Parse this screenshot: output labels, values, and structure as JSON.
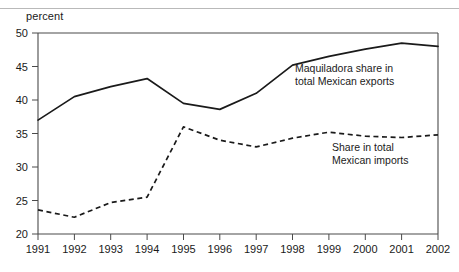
{
  "axis_unit_label": "percent",
  "chart_data": {
    "type": "line",
    "title": "",
    "xlabel": "",
    "ylabel": "percent",
    "xlim": [
      1991,
      2002
    ],
    "ylim": [
      20,
      50
    ],
    "yticks": [
      20,
      25,
      30,
      35,
      40,
      45,
      50
    ],
    "xticks": [
      1991,
      1992,
      1993,
      1994,
      1995,
      1996,
      1997,
      1998,
      1999,
      2000,
      2001,
      2002
    ],
    "grid": false,
    "legend_position": "inline-annotations",
    "categories": [
      "1991",
      "1992",
      "1993",
      "1994",
      "1995",
      "1996",
      "1997",
      "1998",
      "1999",
      "2000",
      "2001",
      "2002"
    ],
    "x": [
      1991,
      1992,
      1993,
      1994,
      1995,
      1996,
      1997,
      1998,
      1999,
      2000,
      2001,
      2002
    ],
    "series": [
      {
        "name": "Maquiladora share in total Mexican exports",
        "style": "solid",
        "color": "#1a1a1a",
        "values": [
          37.0,
          40.5,
          42.0,
          43.2,
          39.5,
          38.6,
          41.0,
          45.2,
          46.5,
          47.6,
          48.5,
          48.0
        ]
      },
      {
        "name": "Share in total Mexican imports",
        "style": "dashed",
        "color": "#1a1a1a",
        "values": [
          23.6,
          22.5,
          24.7,
          25.5,
          36.0,
          34.0,
          33.0,
          34.3,
          35.2,
          34.6,
          34.4,
          34.8
        ]
      }
    ],
    "annotations": [
      {
        "id": "exports",
        "line1": "Maquiladora share in",
        "line2": "total Mexican exports"
      },
      {
        "id": "imports",
        "line1": "Share in total",
        "line2": "Mexican imports"
      }
    ]
  }
}
